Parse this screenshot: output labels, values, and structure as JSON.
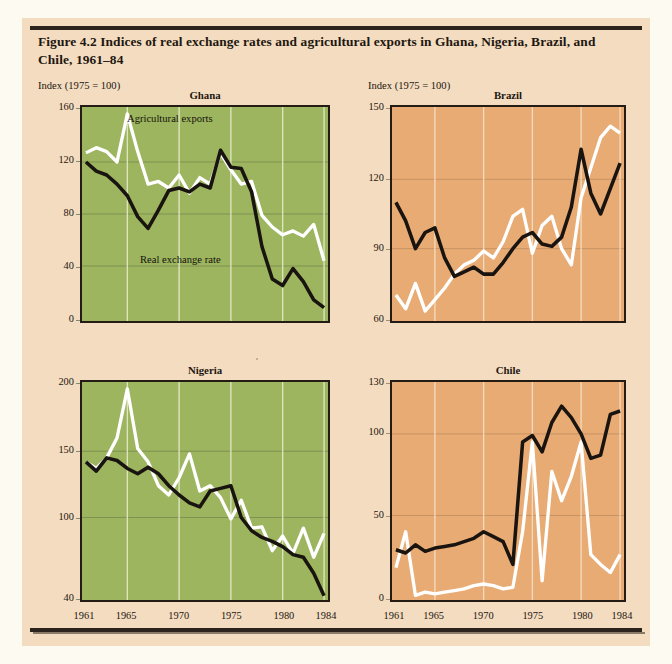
{
  "figure": {
    "title": "Figure 4.2  Indices of real exchange rates and agricultural exports in Ghana, Nigeria, Brazil, and Chile, 1961–84",
    "axis_units_left": "Index (1975 = 100)",
    "axis_units_right": "Index (1975 = 100)",
    "series_label_exports": "Agricultural exports",
    "series_label_rer": "Real exchange rate",
    "color_green_panel": "#9cb55e",
    "color_tan_panel": "#e8ab73",
    "color_page": "#f4dcc0",
    "color_rer_line": "#1a1410",
    "color_exports_line": "#ffffff"
  },
  "chart_data": [
    {
      "type": "line",
      "title": "Ghana",
      "xlabel": "",
      "ylabel": "Index (1975 = 100)",
      "xlim": [
        1961,
        1984
      ],
      "ylim": [
        0,
        160
      ],
      "yticks": [
        0,
        40,
        80,
        120,
        160
      ],
      "xticks": [
        1961,
        1965,
        1970,
        1975,
        1980,
        1984
      ],
      "grid": true,
      "legend": "inline-annotations",
      "x": [
        1961,
        1962,
        1963,
        1964,
        1965,
        1966,
        1967,
        1968,
        1969,
        1970,
        1971,
        1972,
        1973,
        1974,
        1975,
        1976,
        1977,
        1978,
        1979,
        1980,
        1981,
        1982,
        1983,
        1984
      ],
      "series": [
        {
          "name": "Agricultural exports",
          "color": "#ffffff",
          "values": [
            127,
            131,
            128,
            120,
            157,
            128,
            103,
            105,
            100,
            110,
            96,
            108,
            103,
            127,
            114,
            103,
            105,
            79,
            70,
            64,
            67,
            63,
            72,
            44
          ]
        },
        {
          "name": "Real exchange rate",
          "color": "#1a1410",
          "values": [
            120,
            113,
            110,
            103,
            94,
            78,
            69,
            83,
            98,
            100,
            97,
            103,
            100,
            129,
            116,
            115,
            97,
            55,
            30,
            25,
            38,
            28,
            14,
            8
          ]
        }
      ]
    },
    {
      "type": "line",
      "title": "Brazil",
      "xlabel": "",
      "ylabel": "Index (1975 = 100)",
      "xlim": [
        1961,
        1984
      ],
      "ylim": [
        60,
        150
      ],
      "yticks": [
        60,
        90,
        120,
        150
      ],
      "xticks": [
        1961,
        1965,
        1970,
        1975,
        1980,
        1984
      ],
      "grid": true,
      "legend": "inline-annotations",
      "x": [
        1961,
        1962,
        1963,
        1964,
        1965,
        1966,
        1967,
        1968,
        1969,
        1970,
        1971,
        1972,
        1973,
        1974,
        1975,
        1976,
        1977,
        1978,
        1979,
        1980,
        1981,
        1982,
        1983,
        1984
      ],
      "series": [
        {
          "name": "Agricultural exports",
          "color": "#ffffff",
          "values": [
            70,
            64,
            75,
            63,
            68,
            73,
            79,
            83,
            85,
            89,
            86,
            93,
            104,
            107,
            88,
            100,
            104,
            90,
            83,
            112,
            125,
            138,
            143,
            140
          ]
        },
        {
          "name": "Real exchange rate",
          "color": "#1a1410",
          "values": [
            110,
            102,
            90,
            97,
            99,
            86,
            78,
            80,
            82,
            79,
            79,
            84,
            90,
            95,
            97,
            92,
            91,
            95,
            108,
            133,
            114,
            105,
            116,
            127
          ]
        }
      ]
    },
    {
      "type": "line",
      "title": "Nigeria",
      "xlabel": "",
      "ylabel": "Index (1975 = 100)",
      "xlim": [
        1961,
        1984
      ],
      "ylim": [
        40,
        200
      ],
      "yticks": [
        40,
        100,
        150,
        200
      ],
      "xticks": [
        1961,
        1965,
        1970,
        1975,
        1980,
        1984
      ],
      "grid": true,
      "legend": "inline-annotations",
      "x": [
        1961,
        1962,
        1963,
        1964,
        1965,
        1966,
        1967,
        1968,
        1969,
        1970,
        1971,
        1972,
        1973,
        1974,
        1975,
        1976,
        1977,
        1978,
        1979,
        1980,
        1981,
        1982,
        1983,
        1984
      ],
      "series": [
        {
          "name": "Agricultural exports",
          "color": "#ffffff",
          "values": [
            142,
            137,
            145,
            160,
            197,
            152,
            142,
            124,
            117,
            130,
            148,
            120,
            124,
            115,
            99,
            113,
            92,
            93,
            75,
            86,
            73,
            92,
            70,
            88
          ]
        },
        {
          "name": "Real exchange rate",
          "color": "#1a1410",
          "values": [
            142,
            135,
            145,
            143,
            137,
            133,
            138,
            133,
            124,
            117,
            111,
            108,
            120,
            122,
            124,
            100,
            90,
            85,
            82,
            78,
            72,
            70,
            58,
            41
          ]
        }
      ]
    },
    {
      "type": "line",
      "title": "Chile",
      "xlabel": "",
      "ylabel": "Index (1975 = 100)",
      "xlim": [
        1961,
        1984
      ],
      "ylim": [
        0,
        130
      ],
      "yticks": [
        0,
        50,
        100,
        130
      ],
      "xticks": [
        1961,
        1965,
        1970,
        1975,
        1980,
        1984
      ],
      "grid": true,
      "legend": "inline-annotations",
      "x": [
        1961,
        1962,
        1963,
        1964,
        1965,
        1966,
        1967,
        1968,
        1969,
        1970,
        1971,
        1972,
        1973,
        1974,
        1975,
        1976,
        1977,
        1978,
        1979,
        1980,
        1981,
        1982,
        1983,
        1984
      ],
      "series": [
        {
          "name": "Agricultural exports",
          "color": "#ffffff",
          "values": [
            18,
            40,
            1,
            3,
            2,
            3,
            4,
            5,
            7,
            8,
            7,
            5,
            6,
            40,
            95,
            10,
            77,
            59,
            74,
            95,
            26,
            20,
            15,
            26
          ]
        },
        {
          "name": "Real exchange rate",
          "color": "#1a1410",
          "values": [
            29,
            27,
            32,
            28,
            30,
            31,
            32,
            34,
            36,
            40,
            37,
            34,
            20,
            95,
            99,
            89,
            107,
            117,
            110,
            100,
            85,
            87,
            112,
            114
          ]
        }
      ]
    }
  ],
  "panel_labels": {
    "ghana": "Ghana",
    "brazil": "Brazil",
    "nigeria": "Nigeria",
    "chile": "Chile"
  }
}
